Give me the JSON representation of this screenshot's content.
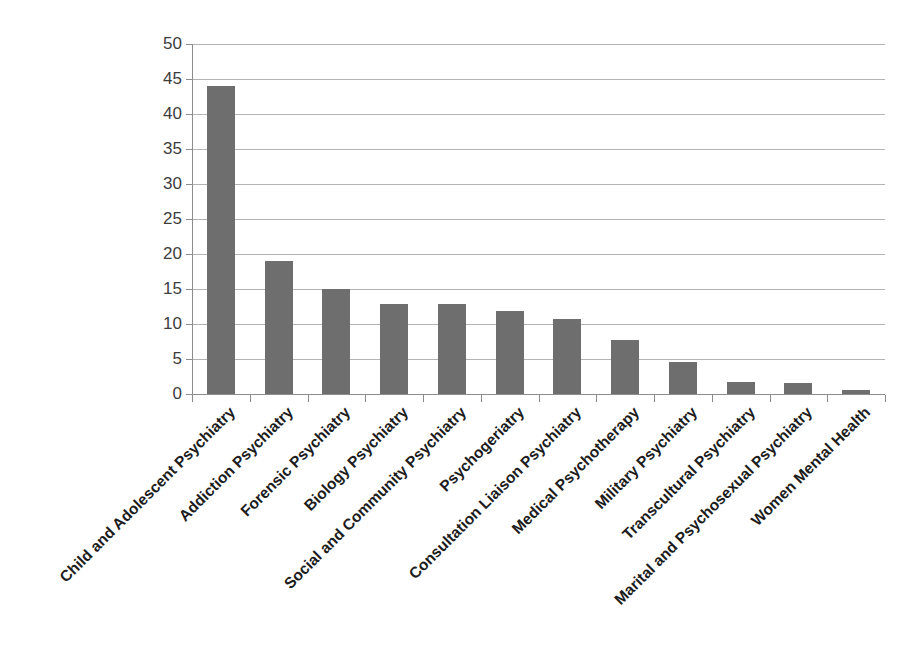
{
  "chart_data": {
    "type": "bar",
    "title": "",
    "subtitle": "",
    "xlabel": "",
    "ylabel": "",
    "ylim": [
      0,
      50
    ],
    "ytick_step": 5,
    "yticks": [
      50,
      45,
      40,
      35,
      30,
      25,
      20,
      15,
      10,
      5,
      0
    ],
    "grid": "horizontal",
    "legend": "none",
    "bar_color": "#6e6e6e",
    "gridline_color": "#b3b3b3",
    "axis_color": "#8c8c8c",
    "label_rotation_deg": 45,
    "categories": [
      "Child and Adolescent Psychiatry",
      "Addiction Psychiatry",
      "Forensic Psychiatry",
      "Biology Psychiatry",
      "Social and Community Psychiatry",
      "Psychogeriatry",
      "Consultation Liaison Psychiatry",
      "Medical Psychotherapy",
      "Military Psychiatry",
      "Transcultural Psychiatry",
      "Marital and Psychosexual Psychiatry",
      "Women Mental Health"
    ],
    "values": [
      44,
      19,
      15,
      12.9,
      12.8,
      11.8,
      10.7,
      7.7,
      4.6,
      1.7,
      1.6,
      0.6
    ]
  }
}
